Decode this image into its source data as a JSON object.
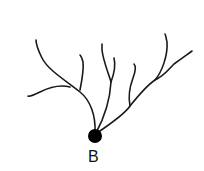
{
  "diagram": {
    "type": "neuron-dendrite-tree",
    "label": "B",
    "stroke_color": "#1a1a1a",
    "soma_color": "#000000"
  }
}
